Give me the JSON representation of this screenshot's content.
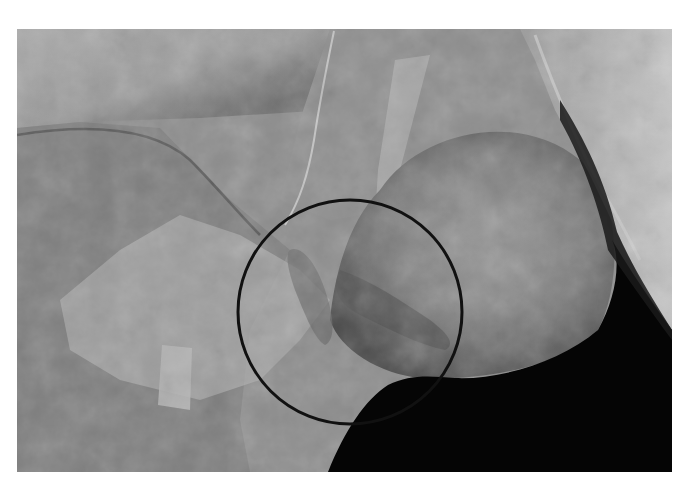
{
  "figure": {
    "frame": {
      "x": 17,
      "y": 29,
      "width": 655,
      "height": 443
    },
    "annotation": {
      "shape": "circle",
      "cx": 350,
      "cy": 312,
      "r": 112,
      "stroke_color": "#111111",
      "stroke_width": 3
    },
    "colors": {
      "page_background": "#ffffff",
      "tissue_light": "#b8b8b8",
      "tissue_mid": "#8f8f8f",
      "tissue_dark": "#5e5e5e",
      "shadow": "#050505"
    }
  }
}
